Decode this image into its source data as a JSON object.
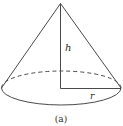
{
  "diagram": {
    "type": "cone",
    "labels": {
      "height": "h",
      "radius": "r",
      "caption": "(a)"
    },
    "colors": {
      "stroke": "#4a4a4a",
      "text": "#2a2a2a",
      "background": "#ffffff"
    }
  }
}
